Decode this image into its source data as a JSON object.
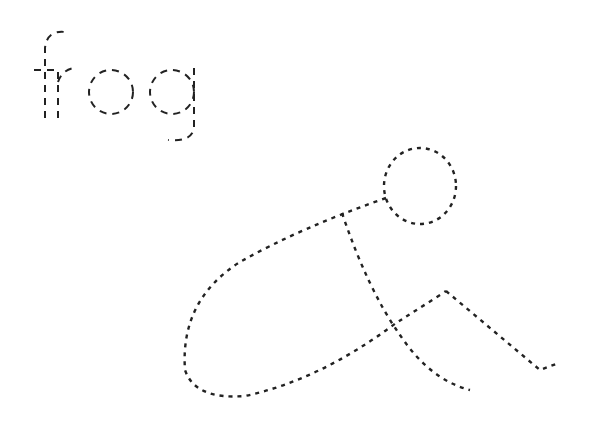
{
  "worksheet": {
    "word": "frog",
    "drawing": "frog-outline",
    "stroke_color": "#222222",
    "background": "#ffffff"
  }
}
